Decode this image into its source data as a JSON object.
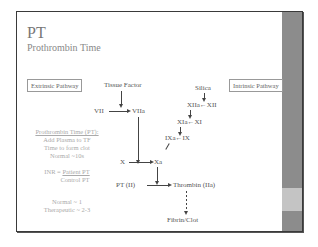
{
  "slide": {
    "title": "PT",
    "subtitle": "Prothrombin Time",
    "boxes": {
      "extrinsic": "Extrinsic Pathway",
      "intrinsic": "Intrinsic Pathway"
    },
    "diagram": {
      "tissue_factor": "Tissue Factor",
      "vii": "VII",
      "viia": "VIIa",
      "silica": "Silica",
      "xiia": "XIIa",
      "xii": "XII",
      "xia": "XIa",
      "xi": "XI",
      "ixa": "IXa",
      "ix": "IX",
      "x": "X",
      "xa": "Xa",
      "pt": "PT (II)",
      "thrombin": "Thrombin (IIa)",
      "fibrin": "Fibrin/Clot"
    },
    "notes": {
      "heading": "Prothrombin Time (PT):",
      "line1": "Add Plasma to TF",
      "line2": "Time to form clot",
      "line3": "Normal ~10s",
      "inr_label": "INR =",
      "inr_num": "Patient PT",
      "inr_den": "Control PT",
      "normal": "Normal ~ 1",
      "therapeutic": "Therapeutic ~ 2-3"
    }
  },
  "colors": {
    "sidebar": "#8c8c8c",
    "sidebar_band": "#c4c4c4",
    "border": "#3a3a3a"
  }
}
